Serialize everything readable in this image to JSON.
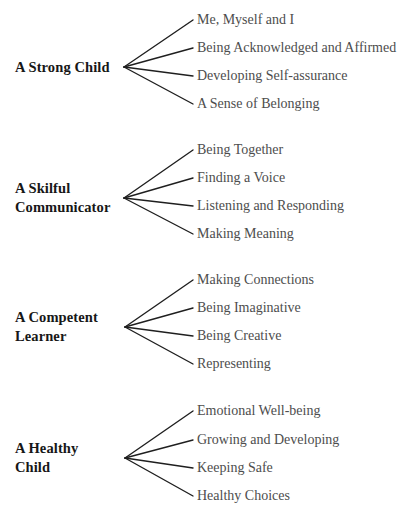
{
  "diagram": {
    "type": "fan-tree",
    "orientation": "left-root-right-leaves",
    "background_color": "#ffffff",
    "root_text_color": "#171717",
    "leaf_text_color": "#4d4d4d",
    "branch_color": "#1f1f1f",
    "groups": [
      {
        "root": "A Strong Child",
        "root_lines": [
          "A Strong Child"
        ],
        "vertex": {
          "x": 124,
          "y": 67
        },
        "leaves": [
          {
            "text": "Me, Myself and I",
            "y": 20
          },
          {
            "text": "Being Acknowledged and Affirmed",
            "y": 48
          },
          {
            "text": "Developing Self-assurance",
            "y": 76
          },
          {
            "text": "A Sense of Belonging",
            "y": 104
          }
        ]
      },
      {
        "root": "A Skilful Communicator",
        "root_lines": [
          "A Skilful",
          "Communicator"
        ],
        "vertex": {
          "x": 124,
          "y": 198
        },
        "leaves": [
          {
            "text": "Being Together",
            "y": 150
          },
          {
            "text": "Finding a Voice",
            "y": 178
          },
          {
            "text": "Listening and Responding",
            "y": 206
          },
          {
            "text": "Making Meaning",
            "y": 234
          }
        ]
      },
      {
        "root": "A Competent Learner",
        "root_lines": [
          "A Competent",
          "Learner"
        ],
        "vertex": {
          "x": 125,
          "y": 327
        },
        "leaves": [
          {
            "text": "Making Connections",
            "y": 280
          },
          {
            "text": "Being Imaginative",
            "y": 308
          },
          {
            "text": "Being Creative",
            "y": 336
          },
          {
            "text": "Representing",
            "y": 364
          }
        ]
      },
      {
        "root": "A Healthy Child",
        "root_lines": [
          "A Healthy",
          "Child"
        ],
        "vertex": {
          "x": 125,
          "y": 458
        },
        "leaves": [
          {
            "text": "Emotional Well-being",
            "y": 411
          },
          {
            "text": "Growing and Developing",
            "y": 440
          },
          {
            "text": "Keeping Safe",
            "y": 468
          },
          {
            "text": "Healthy Choices",
            "y": 496
          }
        ]
      }
    ],
    "leaf_line_end_x": 193,
    "leaf_text_x": 197
  }
}
